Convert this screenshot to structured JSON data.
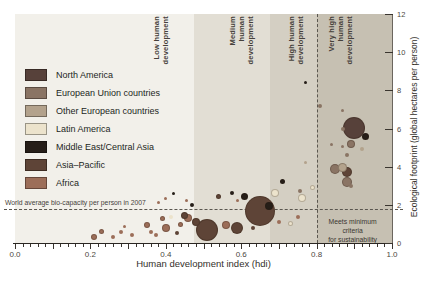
{
  "figure": {
    "x_axis": {
      "title": "Human development index (hdi)",
      "tick_labels": [
        "0.0",
        "0.2",
        "0.4",
        "0.6",
        "0.8",
        "1.0"
      ],
      "min": 0,
      "max": 1,
      "minor_step": 0.02,
      "major_step": 0.1,
      "label_step": 0.2
    },
    "y_axis": {
      "title": "Ecological footprint (global hectares per person)",
      "tick_labels": [
        "0",
        "2",
        "4",
        "6",
        "8",
        "10",
        "12"
      ],
      "min": 0,
      "max": 12,
      "tick_step": 2,
      "side": "right"
    },
    "bands": [
      {
        "lines": [
          "Low human",
          "development"
        ],
        "from": 0,
        "to": 0.476,
        "color": "#f2f0ea",
        "label_x": 137
      },
      {
        "lines": [
          "Medium",
          "human",
          "development"
        ],
        "from": 0.476,
        "to": 0.676,
        "color": "#e2ded4",
        "label_x": 213
      },
      {
        "lines": [
          "High human",
          "development"
        ],
        "from": 0.676,
        "to": 0.8,
        "color": "#d4cfc3",
        "label_x": 272
      },
      {
        "lines": [
          "Very high",
          "human",
          "development"
        ],
        "from": 0.8,
        "to": 1.0,
        "color": "#c6c0b2",
        "label_x": 312
      }
    ],
    "reference_lines": {
      "biocapacity": {
        "value": 1.8,
        "label": "World average bio-capacity per person in 2007"
      },
      "sustainability": {
        "value": 0.8,
        "label_lines": [
          "Meets minimum criteria",
          "for sustainability"
        ]
      }
    },
    "legend": {
      "items": [
        {
          "label": "North America",
          "color": "#57413a"
        },
        {
          "label": "European Union countries",
          "color": "#8a7464"
        },
        {
          "label": "Other European countries",
          "color": "#b3a28c"
        },
        {
          "label": "Latin America",
          "color": "#ece3cc"
        },
        {
          "label": "Middle East/Central Asia",
          "color": "#261e18"
        },
        {
          "label": "Asia–Pacific",
          "color": "#5e4437"
        },
        {
          "label": "Africa",
          "color": "#9c6e59"
        }
      ]
    },
    "chart_data": {
      "type": "bubble",
      "title": "",
      "xlabel": "Human development index (hdi)",
      "ylabel": "Ecological footprint (global hectares per person)",
      "xlim": [
        0,
        1
      ],
      "ylim": [
        0,
        12
      ],
      "grid": false,
      "legend_position": "upper-left",
      "point_format": "[hdi, ecological_footprint_gha, bubble_radius_px]",
      "series": [
        {
          "name": "North America",
          "color": "#57413a",
          "points": [
            [
              0.9,
              6.05,
              11
            ]
          ]
        },
        {
          "name": "European Union countries",
          "color": "#8a7464",
          "points": [
            [
              0.81,
              7.2,
              2
            ],
            [
              0.87,
              6.95,
              1.5
            ],
            [
              0.87,
              6.0,
              2
            ],
            [
              0.89,
              5.2,
              4
            ],
            [
              0.84,
              5.15,
              1.5
            ],
            [
              0.87,
              5.05,
              1.5
            ],
            [
              0.88,
              4.6,
              2
            ],
            [
              0.85,
              3.9,
              5
            ],
            [
              0.88,
              3.2,
              5
            ],
            [
              0.89,
              3.0,
              2
            ],
            [
              0.755,
              2.7,
              2
            ]
          ]
        },
        {
          "name": "Other European countries",
          "color": "#b3a28c",
          "points": [
            [
              0.77,
              4.2,
              1.5
            ],
            [
              0.92,
              4.95,
              2
            ],
            [
              0.87,
              3.95,
              4.5
            ]
          ]
        },
        {
          "name": "Latin America",
          "color": "#ece3cc",
          "points": [
            [
              0.415,
              1.35,
              2
            ],
            [
              0.69,
              2.6,
              4
            ],
            [
              0.73,
              1.0,
              2.5
            ],
            [
              0.76,
              2.35,
              4
            ],
            [
              0.79,
              2.9,
              2.5
            ]
          ]
        },
        {
          "name": "Middle East/Central Asia",
          "color": "#261e18",
          "points": [
            [
              0.42,
              2.6,
              1.5
            ],
            [
              0.47,
              2.0,
              2
            ],
            [
              0.575,
              2.6,
              2
            ],
            [
              0.61,
              2.45,
              3.5
            ],
            [
              0.675,
              1.95,
              4
            ],
            [
              0.71,
              3.2,
              2.5
            ],
            [
              0.77,
              8.4,
              1.5
            ],
            [
              0.93,
              5.6,
              3.5
            ]
          ]
        },
        {
          "name": "Asia–Pacific",
          "color": "#5e4437",
          "points": [
            [
              0.43,
              0.55,
              2
            ],
            [
              0.45,
              1.45,
              3.5
            ],
            [
              0.48,
              1.1,
              4
            ],
            [
              0.51,
              0.7,
              11
            ],
            [
              0.54,
              2.45,
              2.5
            ],
            [
              0.59,
              0.8,
              6
            ],
            [
              0.63,
              0.8,
              2
            ],
            [
              0.65,
              1.7,
              15
            ],
            [
              0.88,
              3.7,
              5
            ]
          ]
        },
        {
          "name": "Africa",
          "color": "#9c6e59",
          "points": [
            [
              0.21,
              0.3,
              3
            ],
            [
              0.23,
              0.6,
              2.5
            ],
            [
              0.26,
              0.3,
              2
            ],
            [
              0.28,
              0.6,
              2
            ],
            [
              0.29,
              0.85,
              1.5
            ],
            [
              0.31,
              0.4,
              2
            ],
            [
              0.35,
              0.95,
              3
            ],
            [
              0.36,
              0.6,
              2
            ],
            [
              0.375,
              0.4,
              2
            ],
            [
              0.39,
              1.3,
              2.5
            ],
            [
              0.4,
              0.8,
              4
            ],
            [
              0.44,
              0.95,
              2.5
            ],
            [
              0.46,
              1.3,
              4
            ],
            [
              0.38,
              2.1,
              1.5
            ],
            [
              0.4,
              2.35,
              1.5
            ],
            [
              0.455,
              2.25,
              1.5
            ],
            [
              0.56,
              0.95,
              4
            ],
            [
              0.59,
              2.25,
              1.5
            ],
            [
              0.7,
              1.1,
              2
            ],
            [
              0.75,
              1.35,
              2
            ]
          ]
        }
      ]
    }
  }
}
